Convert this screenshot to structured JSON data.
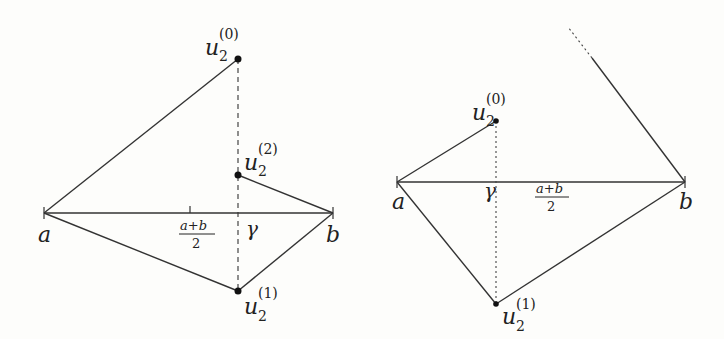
{
  "figure": {
    "left_panel": {
      "endpoints": {
        "left": "a",
        "right": "b"
      },
      "midpoint_label": {
        "numerator": "a+b",
        "denominator": "2"
      },
      "gamma_label": "γ",
      "points": [
        {
          "base": "u",
          "sub": "2",
          "sup": "(0)"
        },
        {
          "base": "u",
          "sub": "2",
          "sup": "(2)"
        },
        {
          "base": "u",
          "sub": "2",
          "sup": "(1)"
        }
      ]
    },
    "right_panel": {
      "endpoints": {
        "left": "a",
        "right": "b"
      },
      "midpoint_label": {
        "numerator": "a+b",
        "denominator": "2"
      },
      "gamma_label": "γ",
      "points": [
        {
          "base": "u",
          "sub": "2",
          "sup": "(0)"
        },
        {
          "base": "u",
          "sub": "2",
          "sup": "(1)"
        }
      ]
    }
  }
}
